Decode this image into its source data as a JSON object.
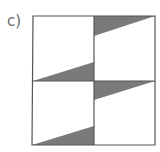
{
  "figure": {
    "label": "c)",
    "colors": {
      "stroke": "#555555",
      "shade": "#7a7a7a",
      "background": "#ffffff"
    },
    "grid": {
      "rows": 2,
      "cols": 2
    },
    "shaded_triangles": [
      {
        "cell": "top-left",
        "corner": "bottom-right"
      },
      {
        "cell": "top-right",
        "corner": "top-left"
      },
      {
        "cell": "bottom-left",
        "corner": "bottom-right"
      },
      {
        "cell": "bottom-right",
        "corner": "top-left"
      }
    ]
  }
}
